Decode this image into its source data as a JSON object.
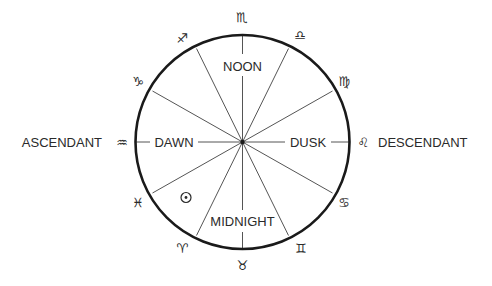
{
  "diagram": {
    "center": {
      "x": 242.5,
      "y": 142
    },
    "radius": 107,
    "colors": {
      "circle": "#1a1a1a",
      "spokes": "#555555",
      "text": "#2a2a2a",
      "background": "#ffffff"
    },
    "time_labels": {
      "noon": "NOON",
      "dawn": "DAWN",
      "dusk": "DUSK",
      "midnight": "MIDNIGHT"
    },
    "horizon_labels": {
      "ascendant": "ASCENDANT",
      "descendant": "DESCENDANT"
    },
    "zodiac": [
      {
        "name": "scorpio",
        "glyph": "♏"
      },
      {
        "name": "libra",
        "glyph": "♎"
      },
      {
        "name": "virgo",
        "glyph": "♍"
      },
      {
        "name": "leo",
        "glyph": "♌"
      },
      {
        "name": "cancer",
        "glyph": "♋"
      },
      {
        "name": "gemini",
        "glyph": "♊"
      },
      {
        "name": "taurus",
        "glyph": "♉"
      },
      {
        "name": "aries",
        "glyph": "♈"
      },
      {
        "name": "pisces",
        "glyph": "♓"
      },
      {
        "name": "aquarius",
        "glyph": "♒"
      },
      {
        "name": "capricorn",
        "glyph": "♑"
      },
      {
        "name": "sagittarius",
        "glyph": "♐"
      }
    ],
    "sun": {
      "name": "sun",
      "glyph": "⊙"
    }
  }
}
